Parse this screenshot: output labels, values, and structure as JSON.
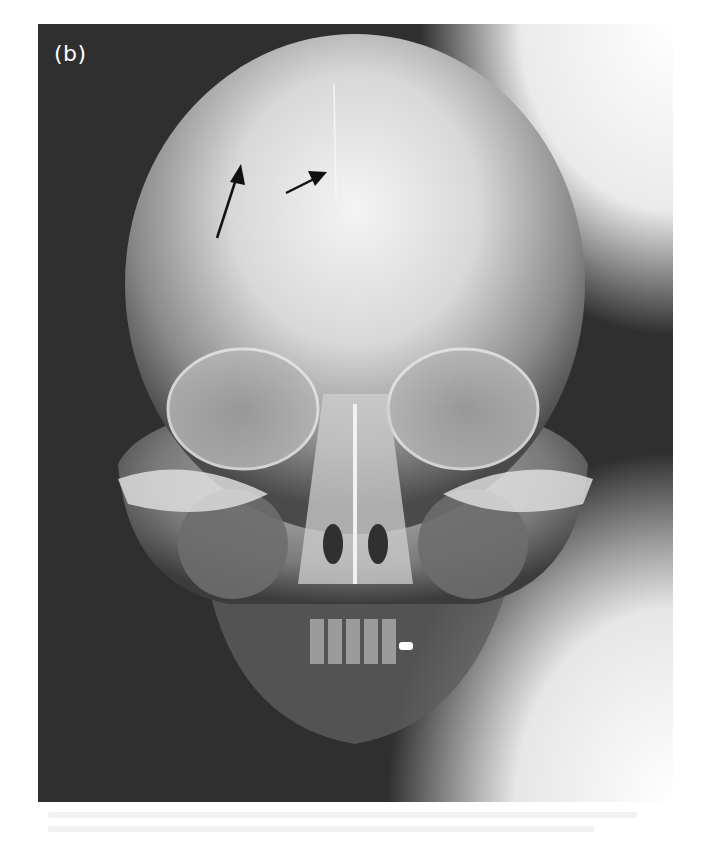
{
  "figure": {
    "panel_label": "(b)",
    "image_type": "frontal skull radiograph",
    "annotations": [
      {
        "type": "arrow",
        "name": "arrow-left",
        "from": [
          217,
          238
        ],
        "to": [
          241,
          164
        ]
      },
      {
        "type": "arrow",
        "name": "arrow-right",
        "from": [
          286,
          193
        ],
        "to": [
          327,
          172
        ]
      }
    ],
    "colors": {
      "background": "#2e2e2e",
      "bone": "#e8e8e8",
      "arrow": "#111111",
      "label": "#ffffff"
    }
  }
}
